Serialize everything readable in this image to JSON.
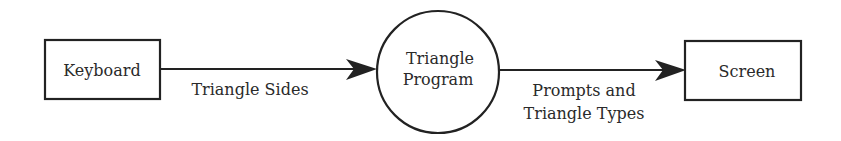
{
  "diagram": {
    "type": "data-flow-diagram",
    "nodes": {
      "keyboard": {
        "label": "Keyboard",
        "shape": "rectangle"
      },
      "program": {
        "line1": "Triangle",
        "line2": "Program",
        "shape": "circle"
      },
      "screen": {
        "label": "Screen",
        "shape": "rectangle"
      }
    },
    "flows": {
      "input": {
        "label": "Triangle Sides",
        "from": "Keyboard",
        "to": "Triangle Program"
      },
      "output": {
        "line1": "Prompts and",
        "line2": "Triangle Types",
        "from": "Triangle Program",
        "to": "Screen"
      }
    },
    "colors": {
      "stroke": "#222222",
      "text": "#2a2a2a",
      "background": "#ffffff"
    }
  }
}
